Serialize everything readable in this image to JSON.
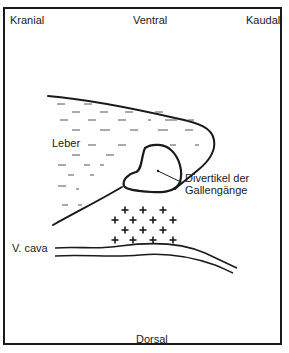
{
  "diagram": {
    "orientation_labels": {
      "top_left": "Kranial",
      "top_center": "Ventral",
      "top_right": "Kaudal",
      "bottom_center": "Dorsal"
    },
    "structures": {
      "liver": "Leber",
      "diverticulum_line1": "Divertikel der",
      "diverticulum_line2": "Gallengänge",
      "vena_cava": "V. cava"
    },
    "colors": {
      "ink": "#1a1a1a",
      "background": "#ffffff"
    }
  }
}
